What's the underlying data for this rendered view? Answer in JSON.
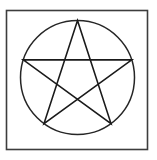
{
  "figure": {
    "background_color": "#ffffff",
    "canvas": {
      "width": 157,
      "height": 160
    }
  },
  "frame": {
    "name": "square-border",
    "x": 6.5,
    "y": 10.5,
    "width": 141,
    "height": 139,
    "stroke_color": "#3d3d3d",
    "stroke_width": 1.6,
    "fill_color": "#ffffff"
  },
  "circle": {
    "name": "enclosing-circle",
    "center_x": 77.5,
    "center_y": 77.5,
    "radius": 57,
    "stroke_color": "#262626",
    "stroke_width": 1.5,
    "fill": "none"
  },
  "star": {
    "name": "pentagram",
    "points": 5,
    "stroke_color": "#1a1a1a",
    "stroke_width": 1.6,
    "fill": "none",
    "circumradius": 57,
    "center_x": 77.5,
    "center_y": 77.5,
    "vertex_angles_deg": [
      -90,
      -18,
      54,
      126,
      198
    ],
    "vertices": [
      {
        "label": "top",
        "x": 77.5,
        "y": 20.5
      },
      {
        "label": "right",
        "x": 131.7,
        "y": 59.9
      },
      {
        "label": "bottom-right",
        "x": 111.0,
        "y": 123.6
      },
      {
        "label": "bottom-left",
        "x": 44.0,
        "y": 123.6
      },
      {
        "label": "left",
        "x": 23.3,
        "y": 59.9
      }
    ],
    "path_order": [
      0,
      2,
      4,
      1,
      3,
      0
    ],
    "path_description": "Unicursal: top -> bottom-right -> left -> right -> bottom-left -> top"
  },
  "colors": {
    "ink": "#1a1a1a",
    "frame": "#3d3d3d",
    "paper": "#ffffff"
  }
}
